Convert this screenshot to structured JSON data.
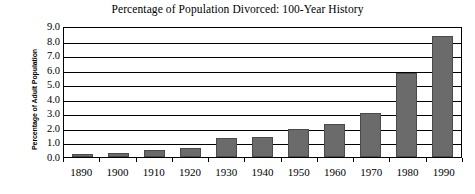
{
  "chart_data": {
    "type": "bar",
    "title": "Percentage of Population Divorced: 100-Year History",
    "xlabel": "",
    "ylabel": "Percentage of Adult Population",
    "categories": [
      "1890",
      "1900",
      "1910",
      "1920",
      "1930",
      "1940",
      "1950",
      "1960",
      "1970",
      "1980",
      "1990"
    ],
    "values": [
      0.2,
      0.3,
      0.45,
      0.65,
      1.3,
      1.4,
      1.9,
      2.3,
      3.0,
      5.8,
      8.3
    ],
    "ylim": [
      0.0,
      9.0
    ],
    "ytick_step": 1.0,
    "ytick_labels": [
      "0.0",
      "1.0",
      "2.0",
      "3.0",
      "4.0",
      "5.0",
      "6.0",
      "7.0",
      "8.0",
      "9.0"
    ],
    "grid": "horizontal",
    "legend": "none",
    "series_color": "#6b6b6b",
    "axis_color": "#000000",
    "background": "#ffffff"
  }
}
